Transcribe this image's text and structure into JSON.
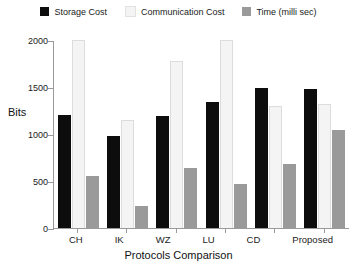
{
  "chart_data": {
    "type": "bar",
    "title": "",
    "xlabel": "Protocols Comparison",
    "ylabel": "Bits",
    "categories": [
      "CH",
      "IK",
      "WZ",
      "LU",
      "CD",
      "Proposed"
    ],
    "ylim": [
      0,
      2000
    ],
    "yticks": [
      0,
      500,
      1000,
      1500,
      2000
    ],
    "ytick_labels": [
      "0",
      "500",
      "1000",
      "1500",
      "2000"
    ],
    "grid": false,
    "legend_position": "top-center",
    "series": [
      {
        "name": "Storage Cost",
        "color": "#0d0d0d",
        "values": [
          1200,
          980,
          1190,
          1340,
          1490,
          1480
        ]
      },
      {
        "name": "Communication Cost",
        "color": "#f4f4f4",
        "values": [
          2000,
          1150,
          1780,
          2000,
          1300,
          1320
        ]
      },
      {
        "name": "Time (milli sec)",
        "color": "#9a9a9a",
        "values": [
          550,
          230,
          640,
          470,
          680,
          1040
        ]
      }
    ]
  }
}
